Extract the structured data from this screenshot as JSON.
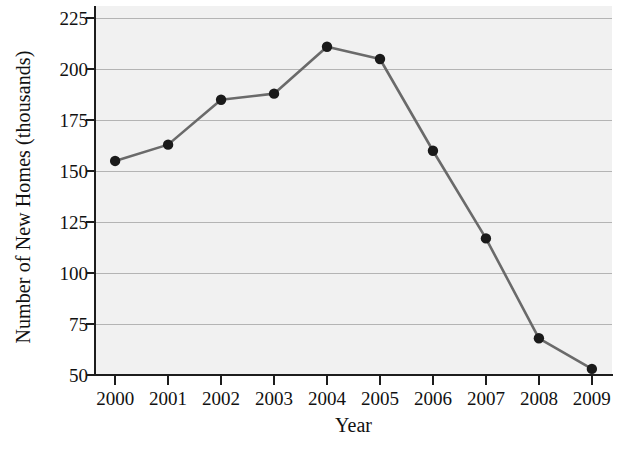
{
  "chart_data": {
    "type": "line",
    "title": "",
    "subtitle": "",
    "xlabel": "Year",
    "ylabel": "Number of New Homes (thousands)",
    "categories": [
      "2000",
      "2001",
      "2002",
      "2003",
      "2004",
      "2005",
      "2006",
      "2007",
      "2008",
      "2009"
    ],
    "x": [
      2000,
      2001,
      2002,
      2003,
      2004,
      2005,
      2006,
      2007,
      2008,
      2009
    ],
    "values": [
      155,
      163,
      185,
      188,
      211,
      205,
      160,
      117,
      68,
      53
    ],
    "series": [
      {
        "name": "Number of New Homes",
        "values": [
          155,
          163,
          185,
          188,
          211,
          205,
          160,
          117,
          68,
          53
        ]
      }
    ],
    "ylim": [
      50,
      231
    ],
    "xlim": [
      1999.62,
      2009.38
    ],
    "yticks": [
      50,
      75,
      100,
      125,
      150,
      175,
      200,
      225
    ],
    "ytick_labels": [
      "50",
      "75",
      "100",
      "125",
      "150",
      "175",
      "200",
      "225"
    ],
    "xticks": [
      2000,
      2001,
      2002,
      2003,
      2004,
      2005,
      2006,
      2007,
      2008,
      2009
    ],
    "xtick_labels": [
      "2000",
      "2001",
      "2002",
      "2003",
      "2004",
      "2005",
      "2006",
      "2007",
      "2008",
      "2009"
    ],
    "grid": true,
    "grid_axis": "y",
    "legend": false,
    "legend_position": "none",
    "marker": "circle",
    "colors": {
      "line": "#6a6a6a",
      "marker": "#1a1a1a",
      "plot_background": "#f1f1f1",
      "gridline": "#b4b4b4",
      "axis": "#1d1d1d",
      "text": "#111111",
      "figure_background": "#ffffff"
    }
  }
}
